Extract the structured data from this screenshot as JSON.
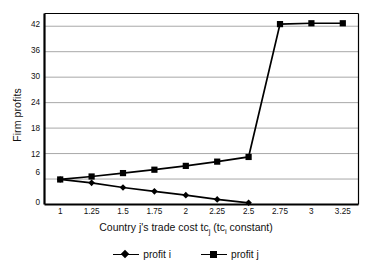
{
  "chart_data": {
    "type": "line",
    "title": "",
    "xlabel": "Country j's trade cost tc_j  (tc_i constant)",
    "xlabel_parts": {
      "pre": "Country j's trade cost tc",
      "sub1": "j",
      "mid": "  (tc",
      "sub2": "i",
      "post": " constant)"
    },
    "ylabel": "Firm profits",
    "x": [
      1,
      1.25,
      1.5,
      1.75,
      2,
      2.25,
      2.5,
      2.75,
      3,
      3.25
    ],
    "xtick_labels": [
      "1",
      "1.25",
      "1.5",
      "1.75",
      "2",
      "2.25",
      "2.5",
      "2.75",
      "3",
      "3.25"
    ],
    "ytick_labels": [
      "0",
      "6",
      "12",
      "18",
      "24",
      "30",
      "36",
      "42"
    ],
    "yticks": [
      0,
      6,
      12,
      18,
      24,
      30,
      36,
      42
    ],
    "ylim": [
      0,
      45
    ],
    "xlim": [
      0.875,
      3.375
    ],
    "grid": "horizontal",
    "legend_position": "bottom",
    "series": [
      {
        "name": "profit i",
        "marker": "diamond",
        "color": "#000000",
        "x": [
          1,
          1.25,
          1.5,
          1.75,
          2,
          2.25,
          2.5
        ],
        "values": [
          5.9,
          5.1,
          4.0,
          3.1,
          2.2,
          1.2,
          0.4
        ]
      },
      {
        "name": "profit j",
        "marker": "square",
        "color": "#000000",
        "x": [
          1,
          1.25,
          1.5,
          1.75,
          2,
          2.25,
          2.5,
          2.75,
          3,
          3.25
        ],
        "values": [
          5.9,
          6.6,
          7.4,
          8.2,
          9.1,
          10.1,
          11.2,
          42.5,
          42.7,
          42.7
        ]
      }
    ]
  },
  "legend": {
    "items": [
      {
        "label": "profit i"
      },
      {
        "label": "profit j"
      }
    ]
  },
  "colors": {
    "axis": "#000000",
    "grid": "#a8a8a8",
    "series": "#000000",
    "background": "#ffffff"
  }
}
